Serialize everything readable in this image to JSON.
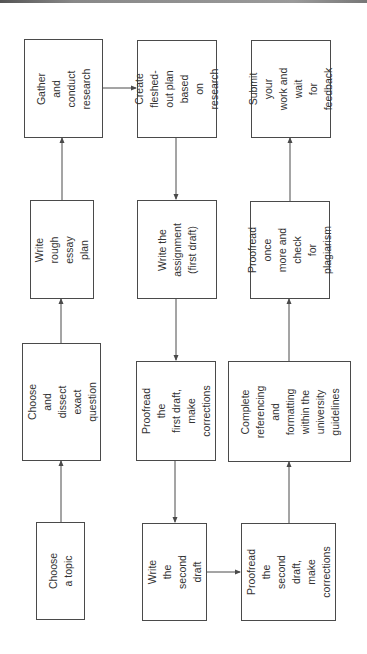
{
  "diagram": {
    "type": "flowchart",
    "orientation": "rotated-90-ccw",
    "colors": {
      "border": "#4a4a4a",
      "text": "#333333",
      "background": "#ffffff",
      "arrow": "#4a4a4a"
    },
    "nodes": [
      {
        "id": "n1",
        "step": 1,
        "label": "Choose a topic"
      },
      {
        "id": "n2",
        "step": 2,
        "label": "Choose and\ndissect exact\nquestion"
      },
      {
        "id": "n3",
        "step": 3,
        "label": "Write rough\nessay plan"
      },
      {
        "id": "n4",
        "step": 4,
        "label": "Gather and\nconduct\nresearch"
      },
      {
        "id": "n5",
        "step": 5,
        "label": "Create fleshed-\nout plan based\non research"
      },
      {
        "id": "n6",
        "step": 6,
        "label": "Write the\nassignment\n(first draft)"
      },
      {
        "id": "n7",
        "step": 7,
        "label": "Proofread the\nfirst draft, make\ncorrections"
      },
      {
        "id": "n8",
        "step": 8,
        "label": "Write the\nsecond draft"
      },
      {
        "id": "n9",
        "step": 9,
        "label": "Proofread the\nsecond draft,\nmake\ncorrections"
      },
      {
        "id": "n10",
        "step": 10,
        "label": "Complete\nreferencing and\nformatting\nwithin the\nuniversity\nguidelines"
      },
      {
        "id": "n11",
        "step": 11,
        "label": "Proofread once\nmore and check\nfor plagiarism"
      },
      {
        "id": "n12",
        "step": 12,
        "label": "Submit your\nwork and wait\nfor feedback"
      }
    ],
    "edges": [
      {
        "from": "n1",
        "to": "n2"
      },
      {
        "from": "n2",
        "to": "n3"
      },
      {
        "from": "n3",
        "to": "n4"
      },
      {
        "from": "n4",
        "to": "n5"
      },
      {
        "from": "n5",
        "to": "n6"
      },
      {
        "from": "n6",
        "to": "n7"
      },
      {
        "from": "n7",
        "to": "n8"
      },
      {
        "from": "n8",
        "to": "n9"
      },
      {
        "from": "n9",
        "to": "n10"
      },
      {
        "from": "n10",
        "to": "n11"
      },
      {
        "from": "n11",
        "to": "n12"
      }
    ]
  }
}
